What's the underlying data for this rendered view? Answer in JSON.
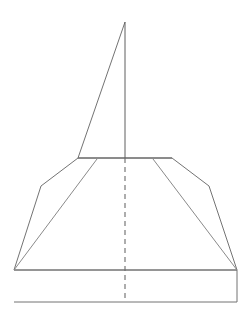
{
  "document": {
    "title": "Technical Line Drawing",
    "description": "Symmetric outline drawing of a pointed-top form over a flared trapezoidal base with a dashed vertical centerline",
    "canvas": {
      "width": 251,
      "height": 327,
      "background_color": "#ffffff"
    }
  },
  "styles": {
    "outline_color": "#737373",
    "thin_outline_color": "#8a8a8a",
    "centerline_color": "#6b6b6b",
    "fill_color": "#ffffff",
    "stroke_width": 1,
    "dash_pattern": "5 4"
  },
  "geometry": {
    "apex": {
      "x": 125,
      "y": 22
    },
    "center_x": 125,
    "shoulder_left": {
      "x": 78,
      "y": 158
    },
    "shoulder_right": {
      "x": 172,
      "y": 158
    },
    "bend_left": {
      "x": 41,
      "y": 186
    },
    "bend_right": {
      "x": 209,
      "y": 186
    },
    "base_top_left": {
      "x": 14,
      "y": 270
    },
    "base_top_right": {
      "x": 237,
      "y": 270
    },
    "base_bottom_left": {
      "x": 14,
      "y": 302
    },
    "base_bottom_right": {
      "x": 237,
      "y": 302
    },
    "inner_diagonal_left_start": {
      "x": 97,
      "y": 159
    },
    "inner_diagonal_right_start": {
      "x": 153,
      "y": 159
    },
    "centerline_top": {
      "x": 125,
      "y": 158
    },
    "centerline_bottom": {
      "x": 125,
      "y": 302
    }
  },
  "shapes": {
    "spire_triangle": {
      "name": "spire-triangle",
      "points": "125,22 78,158 172,158"
    },
    "skirt_outline": {
      "name": "skirt-outline",
      "points": "78,158 41,186 14,270 237,270 209,186 172,158"
    },
    "base_rectangle": {
      "name": "base-rectangle",
      "points": "14,270 237,270 237,302 14,302"
    },
    "inner_diagonal_left": {
      "name": "inner-diagonal-left",
      "points": "97,159 14,270"
    },
    "inner_diagonal_right": {
      "name": "inner-diagonal-right",
      "points": "153,159 237,270"
    },
    "spire_axis": {
      "name": "spire-axis",
      "points": "125,22 125,158"
    },
    "waist_line": {
      "name": "waist-line",
      "points": "78,158 172,158"
    },
    "centerline_dashed": {
      "name": "centerline-dashed",
      "points": "125,158 125,302"
    }
  }
}
